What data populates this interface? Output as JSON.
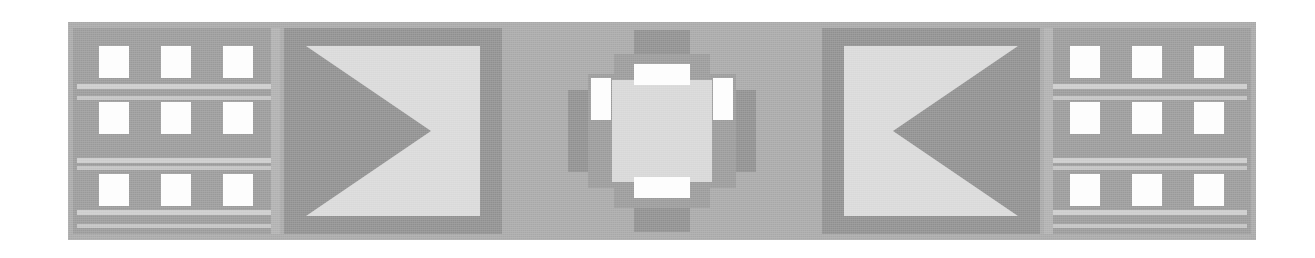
{
  "canvas": {
    "width": 1315,
    "height": 258,
    "background_color": "#ffffff",
    "description": "Grayscale bilaterally-symmetric decorative banner graphic"
  },
  "banner": {
    "name": "symmetric-grayscale-banner",
    "frame_color": "#a8a8a8",
    "x": 68,
    "y": 22,
    "width": 1188,
    "height": 218
  },
  "palette": {
    "frame_gray": "#a8a8a8",
    "panel_gray": "#9a9a9a",
    "dark_gray": "#8f8f8f",
    "light_plate": "#d9d9d9",
    "core_gray": "#d7d7d7",
    "stripe_gray": "#cccccc",
    "cell_white": "#fdfdfd",
    "page_white": "#ffffff"
  },
  "grid_panels": [
    {
      "id": "grid-panel-left",
      "label": "Left grid panel",
      "side": "left",
      "rows": 3,
      "columns": 3,
      "cell_count": 9,
      "background_color": "#9a9a9a",
      "cell_color": "#fdfdfd",
      "stripe_color": "#cccccc",
      "stripe_count": 6,
      "cells": [
        {
          "row": 1,
          "col": 1,
          "x": 26,
          "y": 18
        },
        {
          "row": 1,
          "col": 2,
          "x": 88,
          "y": 18
        },
        {
          "row": 1,
          "col": 3,
          "x": 150,
          "y": 18
        },
        {
          "row": 2,
          "col": 1,
          "x": 26,
          "y": 74
        },
        {
          "row": 2,
          "col": 2,
          "x": 88,
          "y": 74
        },
        {
          "row": 2,
          "col": 3,
          "x": 150,
          "y": 74
        },
        {
          "row": 3,
          "col": 1,
          "x": 26,
          "y": 146
        },
        {
          "row": 3,
          "col": 2,
          "x": 88,
          "y": 146
        },
        {
          "row": 3,
          "col": 3,
          "x": 150,
          "y": 146
        }
      ],
      "stripes": [
        {
          "y": 56,
          "thin": false
        },
        {
          "y": 68,
          "thin": true
        },
        {
          "y": 130,
          "thin": false
        },
        {
          "y": 138,
          "thin": true
        },
        {
          "y": 182,
          "thin": false
        },
        {
          "y": 196,
          "thin": true
        }
      ]
    },
    {
      "id": "grid-panel-right",
      "label": "Right grid panel",
      "side": "right",
      "rows": 3,
      "columns": 3,
      "cell_count": 9,
      "background_color": "#9a9a9a",
      "cell_color": "#fdfdfd",
      "stripe_color": "#cccccc",
      "stripe_count": 6,
      "cells": [
        {
          "row": 1,
          "col": 1,
          "x": 26,
          "y": 18
        },
        {
          "row": 1,
          "col": 2,
          "x": 88,
          "y": 18
        },
        {
          "row": 1,
          "col": 3,
          "x": 150,
          "y": 18
        },
        {
          "row": 2,
          "col": 1,
          "x": 26,
          "y": 74
        },
        {
          "row": 2,
          "col": 2,
          "x": 88,
          "y": 74
        },
        {
          "row": 2,
          "col": 3,
          "x": 150,
          "y": 74
        },
        {
          "row": 3,
          "col": 1,
          "x": 26,
          "y": 146
        },
        {
          "row": 3,
          "col": 2,
          "x": 88,
          "y": 146
        },
        {
          "row": 3,
          "col": 3,
          "x": 150,
          "y": 146
        }
      ],
      "stripes": [
        {
          "y": 56,
          "thin": false
        },
        {
          "y": 68,
          "thin": true
        },
        {
          "y": 130,
          "thin": false
        },
        {
          "y": 138,
          "thin": true
        },
        {
          "y": 182,
          "thin": false
        },
        {
          "y": 196,
          "thin": true
        }
      ]
    }
  ],
  "triangle_panels": [
    {
      "id": "tri-panel-left",
      "label": "Left arrow panel",
      "direction": "right",
      "icon": "triangle-right-icon",
      "surround_color": "#8f8f8f",
      "plate_color": "#d9d9d9",
      "triangle_color": "#8f8f8f",
      "apex_x": 452,
      "apex_y": 130
    },
    {
      "id": "tri-panel-right",
      "label": "Right arrow panel",
      "direction": "left",
      "icon": "triangle-left-icon",
      "surround_color": "#8f8f8f",
      "plate_color": "#d9d9d9",
      "triangle_color": "#8f8f8f",
      "apex_x": 872,
      "apex_y": 130
    }
  ],
  "center_medallion": {
    "id": "center-medallion",
    "label": "Center cross medallion",
    "core_color": "#d7d7d7",
    "arm_color": "#8f8f8f",
    "step_color": "#9a9a9a",
    "slot_color": "#fdfdfd",
    "slot_count": 4,
    "slots": [
      {
        "position": "top",
        "orientation": "horizontal",
        "width": 56,
        "height": 21
      },
      {
        "position": "right",
        "orientation": "vertical",
        "width": 20,
        "height": 42
      },
      {
        "position": "bottom",
        "orientation": "horizontal",
        "width": 56,
        "height": 21
      },
      {
        "position": "left",
        "orientation": "vertical",
        "width": 20,
        "height": 42
      }
    ],
    "arms": [
      "top",
      "right",
      "bottom",
      "left"
    ]
  }
}
